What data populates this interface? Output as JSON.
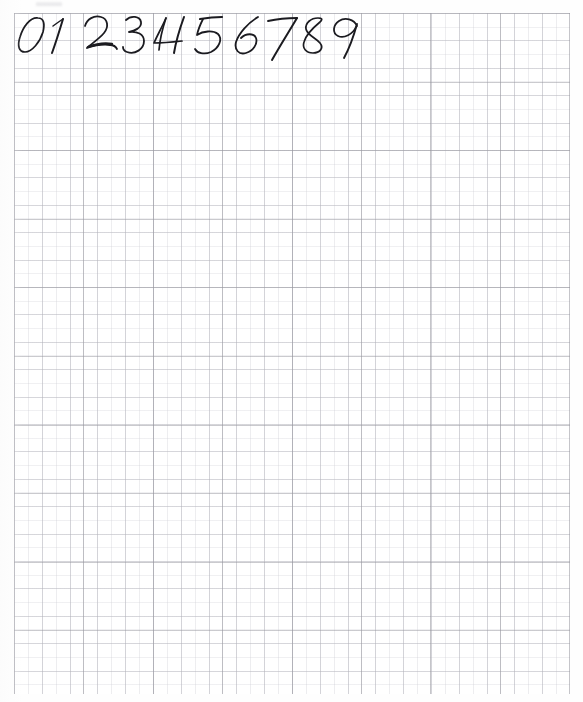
{
  "page": {
    "kind": "scanned-graph-paper",
    "width": 583,
    "height": 702,
    "background_color": "#fefefe",
    "paper_color": "#ffffff"
  },
  "grid": {
    "label": "graph-paper-grid",
    "left": 14,
    "top": 13,
    "width": 556,
    "height": 681,
    "minor_spacing_px": 13.9,
    "medium_spacing_px": 27.8,
    "major_spacing_px": 69.4,
    "minor_color": "#cbcbd2",
    "medium_color": "#b0b0b8",
    "major_color": "#96969e"
  },
  "handwriting": {
    "label": "handwritten-digit-row",
    "description": "Cursive handwritten digits zero through nine written in dark ink across the top row of the graph paper",
    "ink_color": "#1b1b20",
    "baseline_y": 50,
    "cap_y": 16,
    "digits": [
      {
        "char": "0",
        "name": "digit-zero",
        "x": 17,
        "width": 30
      },
      {
        "char": "1",
        "name": "digit-one",
        "x": 50,
        "width": 22
      },
      {
        "char": "2",
        "name": "digit-two",
        "x": 84,
        "width": 34
      },
      {
        "char": "3",
        "name": "digit-three",
        "x": 123,
        "width": 30
      },
      {
        "char": "4",
        "name": "digit-four",
        "x": 157,
        "width": 34
      },
      {
        "char": "5",
        "name": "digit-five",
        "x": 194,
        "width": 32
      },
      {
        "char": "6",
        "name": "digit-six",
        "x": 234,
        "width": 30
      },
      {
        "char": "7",
        "name": "digit-seven",
        "x": 266,
        "width": 34
      },
      {
        "char": "8",
        "name": "digit-eight",
        "x": 300,
        "width": 30
      },
      {
        "char": "9",
        "name": "digit-nine",
        "x": 330,
        "width": 32
      }
    ],
    "sequence_text": "0 1 2 3 4 5 6 7 8 9"
  }
}
